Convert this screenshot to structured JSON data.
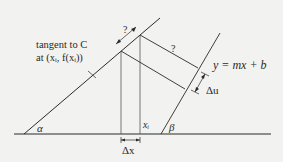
{
  "diagram": {
    "tangent_label_line1": "tangent to C",
    "tangent_label_line2": "at (xᵢ, f(xᵢ))",
    "line_label": "y = mx + b",
    "alpha": "α",
    "beta": "β",
    "xi": "xᵢ",
    "delta_x": "Δx",
    "delta_u": "Δu",
    "q_top": "?",
    "q_mid": "?",
    "colors": {
      "line": "#2a2a2a",
      "thin": "#555555",
      "background": "#f2f2f0"
    }
  }
}
